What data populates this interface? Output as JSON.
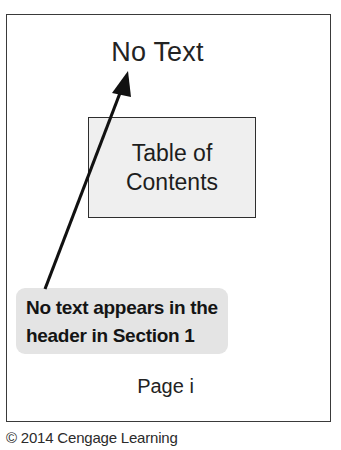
{
  "figure": {
    "document_page": {
      "header_label": "No Text",
      "toc_block": {
        "line1": "Table of",
        "line2": "Contents"
      },
      "page_number": "Page i"
    },
    "callout": {
      "line1": "No text appears in the",
      "line2": "header in Section 1"
    },
    "arrow": {
      "icon": "annotation-arrow-icon"
    },
    "credit": "© 2014 Cengage Learning",
    "colors": {
      "page_border": "#3a3a3a",
      "toc_fill": "#efefef",
      "toc_border": "#2e2e2e",
      "callout_fill": "#e4e4e4",
      "arrow": "#111111",
      "text": "#1d1d1d"
    }
  }
}
